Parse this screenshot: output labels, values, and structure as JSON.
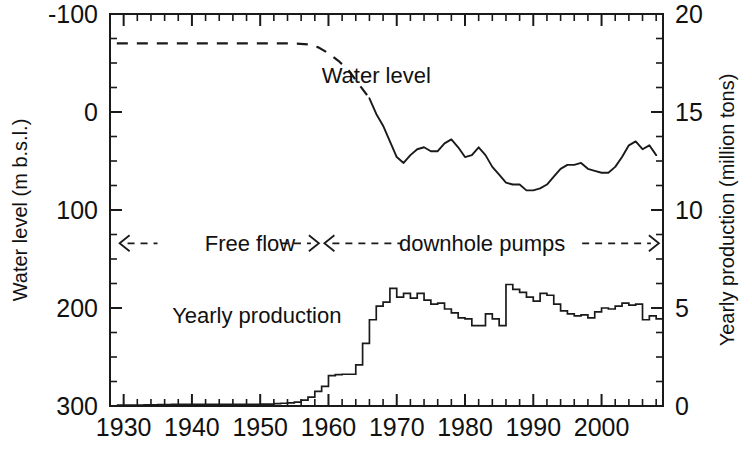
{
  "chart_data": {
    "type": "line",
    "title": "",
    "xlabel": "",
    "ylabel": "Water level (m b.s.l.)",
    "ylabel_right": "Yearly production (million tons)",
    "xlim": [
      1928,
      2009
    ],
    "ylim_left": [
      -100,
      300
    ],
    "ylim_right": [
      0,
      20
    ],
    "y_left_inverted": true,
    "grid": false,
    "legend": "none",
    "xticks_major": [
      1930,
      1940,
      1950,
      1960,
      1970,
      1980,
      1990,
      2000
    ],
    "xticks_major_labels": [
      "1930",
      "1940",
      "1950",
      "1960",
      "1970",
      "1980",
      "1990",
      "2000"
    ],
    "xticks_minor_step": 2,
    "yticks_left_major": [
      -100,
      0,
      100,
      200,
      300
    ],
    "yticks_left_labels": [
      "-100",
      "0",
      "100",
      "200",
      "300"
    ],
    "yticks_left_minor_step": 25,
    "yticks_right_major": [
      0,
      5,
      10,
      15,
      20
    ],
    "yticks_right_labels": [
      "0",
      "5",
      "10",
      "15",
      "20"
    ],
    "yticks_right_minor_step": 1.25,
    "annotations": [
      {
        "name": "water-level-label",
        "text": "Water level",
        "x": 1967,
        "y_left": -38
      },
      {
        "name": "yearly-production-label",
        "text": "Yearly production",
        "x": 1949.5,
        "y_left": 207
      },
      {
        "name": "free-flow-label",
        "text": "Free flow",
        "x": 1948.5,
        "y_left": 134
      },
      {
        "name": "downhole-pumps-label",
        "text": "downhole pumps",
        "x": 1982.5,
        "y_left": 134
      }
    ],
    "phase_spans": [
      {
        "name": "free-flow-span",
        "label": "Free flow",
        "x_start": 1929.4,
        "x_end": 1958.6,
        "y_left": 134
      },
      {
        "name": "downhole-pumps-span",
        "label": "downhole pumps",
        "x_start": 1959.4,
        "x_end": 2008.4,
        "y_left": 134
      }
    ],
    "series": [
      {
        "name": "Water level (historical, dashed)",
        "style": "dashed",
        "axis": "left",
        "units": "m b.s.l.",
        "x": [
          1929,
          1932,
          1936,
          1940,
          1944,
          1948,
          1952,
          1955,
          1957,
          1958.5,
          1960,
          1961.5,
          1963,
          1964.5,
          1966
        ],
        "values": [
          -70,
          -70,
          -70,
          -70,
          -70,
          -70,
          -70,
          -70,
          -69,
          -66,
          -60,
          -52,
          -42,
          -28,
          -14
        ]
      },
      {
        "name": "Water level (measured, solid)",
        "style": "solid",
        "axis": "left",
        "units": "m b.s.l.",
        "x": [
          1966,
          1967,
          1968,
          1969,
          1970,
          1971,
          1972,
          1973,
          1974,
          1975,
          1976,
          1977,
          1978,
          1979,
          1980,
          1981,
          1982,
          1983,
          1984,
          1985,
          1986,
          1987,
          1988,
          1989,
          1990,
          1991,
          1992,
          1993,
          1994,
          1995,
          1996,
          1997,
          1998,
          1999,
          2000,
          2001,
          2002,
          2003,
          2004,
          2005,
          2006,
          2007,
          2008
        ],
        "values": [
          -14,
          2,
          14,
          30,
          46,
          52,
          44,
          38,
          36,
          40,
          40,
          32,
          28,
          36,
          46,
          44,
          36,
          44,
          56,
          64,
          72,
          74,
          74,
          80,
          80,
          78,
          74,
          66,
          58,
          54,
          54,
          52,
          58,
          60,
          62,
          62,
          56,
          46,
          34,
          30,
          38,
          34,
          44
        ]
      },
      {
        "name": "Yearly production",
        "style": "step",
        "axis": "right",
        "units": "million tons",
        "x": [
          1929,
          1930,
          1931,
          1932,
          1933,
          1934,
          1935,
          1936,
          1937,
          1938,
          1939,
          1940,
          1941,
          1942,
          1943,
          1944,
          1945,
          1946,
          1947,
          1948,
          1949,
          1950,
          1951,
          1952,
          1953,
          1954,
          1955,
          1956,
          1957,
          1958,
          1959,
          1960,
          1961,
          1962,
          1963,
          1964,
          1965,
          1966,
          1967,
          1968,
          1969,
          1970,
          1971,
          1972,
          1973,
          1974,
          1975,
          1976,
          1977,
          1978,
          1979,
          1980,
          1981,
          1982,
          1983,
          1984,
          1985,
          1986,
          1987,
          1988,
          1989,
          1990,
          1991,
          1992,
          1993,
          1994,
          1995,
          1996,
          1997,
          1998,
          1999,
          2000,
          2001,
          2002,
          2003,
          2004,
          2005,
          2006,
          2007,
          2008
        ],
        "values": [
          0.05,
          0.05,
          0.05,
          0.05,
          0.06,
          0.06,
          0.07,
          0.07,
          0.08,
          0.08,
          0.08,
          0.08,
          0.08,
          0.08,
          0.08,
          0.08,
          0.08,
          0.08,
          0.08,
          0.09,
          0.09,
          0.1,
          0.1,
          0.12,
          0.14,
          0.16,
          0.2,
          0.3,
          0.45,
          0.75,
          1.0,
          1.55,
          1.6,
          1.62,
          1.62,
          2.1,
          3.2,
          4.4,
          5.1,
          5.3,
          6.0,
          5.55,
          5.75,
          5.5,
          5.75,
          5.4,
          5.2,
          5.25,
          4.95,
          4.75,
          4.5,
          4.45,
          4.1,
          4.1,
          4.7,
          4.45,
          4.1,
          6.2,
          5.95,
          5.8,
          5.55,
          5.35,
          5.75,
          5.65,
          5.2,
          4.85,
          4.7,
          4.6,
          4.65,
          4.5,
          4.8,
          5.0,
          4.95,
          5.1,
          5.25,
          5.15,
          5.2,
          4.4,
          4.6,
          4.45
        ]
      }
    ]
  },
  "colors": {
    "ink": "#1a1a1a",
    "background": "#ffffff"
  }
}
